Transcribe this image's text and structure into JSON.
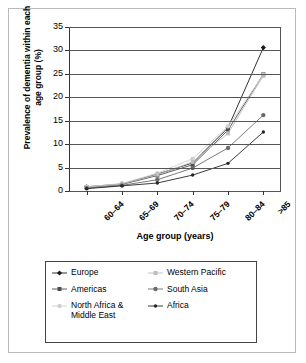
{
  "chart_data": {
    "type": "line",
    "title": "",
    "xlabel": "Age group (years)",
    "ylabel": "Prevalence of dementia within each age group (%)",
    "categories": [
      "60–64",
      "65–69",
      "70–74",
      "75–79",
      "80–84",
      ">85"
    ],
    "ylim": [
      0,
      35
    ],
    "yticks": [
      0,
      5,
      10,
      15,
      20,
      25,
      30,
      35
    ],
    "grid": true,
    "legend_position": "bottom",
    "series": [
      {
        "name": "Europe",
        "color": "#1a1a1a",
        "marker": "diamond",
        "values": [
          0.9,
          1.5,
          3.6,
          6.0,
          13.5,
          30.6
        ]
      },
      {
        "name": "Americas",
        "color": "#4d4d4d",
        "marker": "square",
        "values": [
          0.8,
          1.4,
          3.3,
          5.6,
          13.0,
          24.9
        ]
      },
      {
        "name": "North Africa & Middle East",
        "color": "#cfcfcf",
        "marker": "circle",
        "values": [
          0.9,
          1.6,
          3.8,
          6.9,
          13.8,
          24.8
        ]
      },
      {
        "name": "Western Pacific",
        "color": "#bdbdbd",
        "marker": "cross",
        "values": [
          0.8,
          1.5,
          3.5,
          6.2,
          12.3,
          24.6
        ]
      },
      {
        "name": "South Asia",
        "color": "#6b6b6b",
        "marker": "circle",
        "values": [
          0.6,
          1.2,
          2.4,
          4.9,
          9.2,
          16.2
        ]
      },
      {
        "name": "Africa",
        "color": "#262626",
        "marker": "dot",
        "values": [
          0.5,
          1.1,
          1.7,
          3.4,
          5.9,
          12.6
        ]
      }
    ]
  },
  "legend": {
    "entries": [
      {
        "label": "Europe"
      },
      {
        "label": "Western Pacific"
      },
      {
        "label": "Americas"
      },
      {
        "label": "South Asia"
      },
      {
        "label": "North Africa & Middle East"
      },
      {
        "label": "Africa"
      }
    ]
  }
}
